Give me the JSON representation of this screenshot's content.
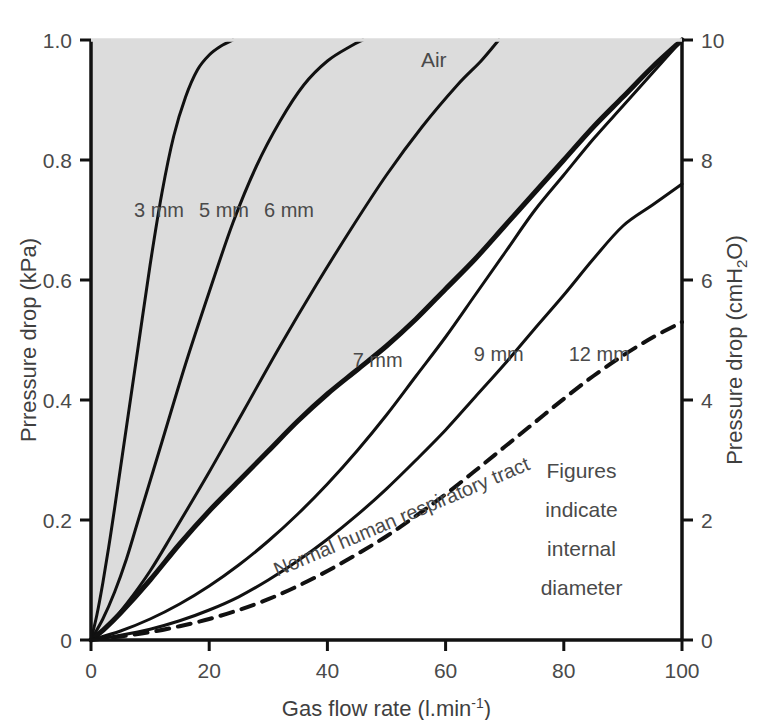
{
  "chart_data": {
    "type": "line",
    "title": "",
    "xlabel": "Gas flow rate (l.min",
    "xlabel_sup": "-1",
    "xlabel_tail": ")",
    "ylabel_left": "Prressure drop (kPa)",
    "ylabel_right_pre": "Pressure drop (cmH",
    "ylabel_right_sub": "2",
    "ylabel_right_post": "O)",
    "xlim": [
      0,
      100
    ],
    "ylim_left": [
      0,
      1.0
    ],
    "ylim_right": [
      0,
      10
    ],
    "xticks": [
      "0",
      "20",
      "40",
      "60",
      "80",
      "100"
    ],
    "xtick_values": [
      0,
      20,
      40,
      60,
      80,
      100
    ],
    "yticks_left": [
      "0",
      "0.2",
      "0.4",
      "0.6",
      "0.8",
      "1.0"
    ],
    "ytick_left_values": [
      0,
      0.2,
      0.4,
      0.6,
      0.8,
      1.0
    ],
    "yticks_right": [
      "0",
      "2",
      "4",
      "6",
      "8",
      "10"
    ],
    "ytick_right_values": [
      0,
      2,
      4,
      6,
      8,
      10
    ],
    "grid": false,
    "legend_position": "inline-labels",
    "shaded_region_label": "Air",
    "shaded_region_color": "#dcdcdc",
    "annotations": [
      {
        "text": "Air",
        "x": 58,
        "y": 0.955
      },
      {
        "text": "Figures",
        "x": 83,
        "y": 0.27
      },
      {
        "text": "indicate",
        "x": 83,
        "y": 0.205
      },
      {
        "text": "internal",
        "x": 83,
        "y": 0.14
      },
      {
        "text": "diameter",
        "x": 83,
        "y": 0.075
      }
    ],
    "series": [
      {
        "name": "3 mm",
        "label": "3 mm",
        "style": "solid",
        "width": 3,
        "label_x": 11.5,
        "label_y": 0.705,
        "points": [
          [
            0,
            0
          ],
          [
            1,
            0.042
          ],
          [
            2,
            0.095
          ],
          [
            3,
            0.155
          ],
          [
            4,
            0.22
          ],
          [
            6,
            0.355
          ],
          [
            8,
            0.49
          ],
          [
            10,
            0.625
          ],
          [
            12,
            0.745
          ],
          [
            14,
            0.84
          ],
          [
            16,
            0.905
          ],
          [
            18,
            0.95
          ],
          [
            20,
            0.975
          ],
          [
            22,
            0.99
          ],
          [
            24,
            1.0
          ]
        ]
      },
      {
        "name": "5 mm",
        "label": "5 mm",
        "style": "solid",
        "width": 3,
        "label_x": 22.5,
        "label_y": 0.705,
        "points": [
          [
            0,
            0
          ],
          [
            2,
            0.035
          ],
          [
            4,
            0.08
          ],
          [
            6,
            0.135
          ],
          [
            8,
            0.2
          ],
          [
            12,
            0.33
          ],
          [
            16,
            0.46
          ],
          [
            20,
            0.58
          ],
          [
            24,
            0.695
          ],
          [
            28,
            0.79
          ],
          [
            32,
            0.865
          ],
          [
            36,
            0.925
          ],
          [
            40,
            0.965
          ],
          [
            44,
            0.99
          ],
          [
            46,
            1.0
          ]
        ]
      },
      {
        "name": "6 mm",
        "label": "6 mm",
        "style": "solid",
        "width": 3,
        "label_x": 33.5,
        "label_y": 0.705,
        "points": [
          [
            0,
            0
          ],
          [
            3,
            0.025
          ],
          [
            6,
            0.06
          ],
          [
            10,
            0.115
          ],
          [
            14,
            0.18
          ],
          [
            20,
            0.28
          ],
          [
            26,
            0.385
          ],
          [
            32,
            0.49
          ],
          [
            38,
            0.59
          ],
          [
            44,
            0.685
          ],
          [
            50,
            0.775
          ],
          [
            56,
            0.855
          ],
          [
            62,
            0.925
          ],
          [
            66,
            0.965
          ],
          [
            69,
            1.0
          ]
        ]
      },
      {
        "name": "7 mm",
        "label": "7 mm",
        "style": "solid",
        "width": 5,
        "label_x": 48.5,
        "label_y": 0.455,
        "points": [
          [
            0,
            0
          ],
          [
            2,
            0.016
          ],
          [
            5,
            0.045
          ],
          [
            10,
            0.1
          ],
          [
            15,
            0.16
          ],
          [
            20,
            0.215
          ],
          [
            25,
            0.265
          ],
          [
            30,
            0.315
          ],
          [
            35,
            0.365
          ],
          [
            40,
            0.41
          ],
          [
            45,
            0.45
          ],
          [
            50,
            0.49
          ],
          [
            55,
            0.535
          ],
          [
            60,
            0.585
          ],
          [
            65,
            0.635
          ],
          [
            70,
            0.69
          ],
          [
            75,
            0.745
          ],
          [
            80,
            0.8
          ],
          [
            85,
            0.855
          ],
          [
            90,
            0.905
          ],
          [
            95,
            0.955
          ],
          [
            100,
            1.0
          ]
        ]
      },
      {
        "name": "9 mm",
        "label": "9 mm",
        "style": "solid",
        "width": 3,
        "label_x": 69,
        "label_y": 0.465,
        "points": [
          [
            0,
            0
          ],
          [
            5,
            0.015
          ],
          [
            10,
            0.035
          ],
          [
            15,
            0.06
          ],
          [
            20,
            0.09
          ],
          [
            25,
            0.125
          ],
          [
            30,
            0.165
          ],
          [
            35,
            0.21
          ],
          [
            40,
            0.26
          ],
          [
            45,
            0.315
          ],
          [
            50,
            0.375
          ],
          [
            55,
            0.44
          ],
          [
            60,
            0.505
          ],
          [
            65,
            0.575
          ],
          [
            70,
            0.645
          ],
          [
            75,
            0.715
          ],
          [
            80,
            0.775
          ],
          [
            85,
            0.835
          ],
          [
            90,
            0.89
          ],
          [
            95,
            0.945
          ],
          [
            100,
            1.0
          ]
        ]
      },
      {
        "name": "12 mm",
        "label": "12 mm",
        "style": "solid",
        "width": 3,
        "label_x": 86,
        "label_y": 0.465,
        "points": [
          [
            0,
            0
          ],
          [
            5,
            0.008
          ],
          [
            10,
            0.018
          ],
          [
            15,
            0.032
          ],
          [
            20,
            0.05
          ],
          [
            25,
            0.072
          ],
          [
            30,
            0.1
          ],
          [
            35,
            0.132
          ],
          [
            40,
            0.168
          ],
          [
            45,
            0.208
          ],
          [
            50,
            0.252
          ],
          [
            55,
            0.3
          ],
          [
            60,
            0.35
          ],
          [
            65,
            0.405
          ],
          [
            70,
            0.46
          ],
          [
            75,
            0.518
          ],
          [
            80,
            0.575
          ],
          [
            85,
            0.635
          ],
          [
            90,
            0.69
          ],
          [
            95,
            0.725
          ],
          [
            100,
            0.76
          ]
        ]
      },
      {
        "name": "Normal human respiratory tract",
        "label": "Normal human respiratory tract",
        "style": "dashed",
        "width": 4,
        "label_x": 53,
        "label_y": 0.195,
        "points": [
          [
            0,
            0
          ],
          [
            5,
            0.006
          ],
          [
            10,
            0.013
          ],
          [
            15,
            0.023
          ],
          [
            20,
            0.035
          ],
          [
            25,
            0.05
          ],
          [
            30,
            0.068
          ],
          [
            35,
            0.09
          ],
          [
            40,
            0.115
          ],
          [
            45,
            0.143
          ],
          [
            50,
            0.173
          ],
          [
            55,
            0.207
          ],
          [
            60,
            0.243
          ],
          [
            65,
            0.282
          ],
          [
            70,
            0.322
          ],
          [
            75,
            0.362
          ],
          [
            80,
            0.402
          ],
          [
            85,
            0.44
          ],
          [
            90,
            0.474
          ],
          [
            95,
            0.504
          ],
          [
            100,
            0.53
          ]
        ]
      }
    ]
  },
  "axes": {
    "x_title_main": "Gas flow rate (l.min",
    "x_title_sup": "-1",
    "x_title_end": ")",
    "y_left_title": "Prressure drop (kPa)",
    "y_right_title_a": "Pressure drop (cmH",
    "y_right_title_sub": "2",
    "y_right_title_b": "O)"
  },
  "labels": {
    "air": "Air",
    "note_line1": "Figures",
    "note_line2": "indicate",
    "note_line3": "internal",
    "note_line4": "diameter",
    "dashed_curve": "Normal human respiratory tract",
    "d3": "3 mm",
    "d5": "5 mm",
    "d6": "6 mm",
    "d7": "7 mm",
    "d9": "9 mm",
    "d12": "12 mm"
  },
  "ticks": {
    "x": [
      "0",
      "20",
      "40",
      "60",
      "80",
      "100"
    ],
    "y_left": [
      "0",
      "0.2",
      "0.4",
      "0.6",
      "0.8",
      "1.0"
    ],
    "y_right": [
      "0",
      "2",
      "4",
      "6",
      "8",
      "10"
    ]
  },
  "colors": {
    "line": "#111111",
    "shade": "#dcdcdc",
    "text": "#4a4a4a",
    "background": "#ffffff"
  }
}
